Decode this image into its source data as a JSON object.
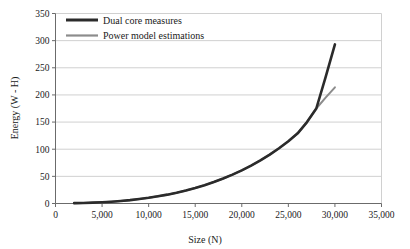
{
  "chart_data": {
    "type": "line",
    "title": "",
    "xlabel": "Size (N)",
    "ylabel": "Energy (W - H)",
    "xlim": [
      0,
      35000
    ],
    "ylim": [
      0,
      350
    ],
    "xticks": [
      0,
      5000,
      10000,
      15000,
      20000,
      25000,
      30000,
      35000
    ],
    "xtick_labels": [
      "0",
      "5,000",
      "10,000",
      "15,000",
      "20,000",
      "25,000",
      "30,000",
      "35,000"
    ],
    "yticks": [
      0,
      50,
      100,
      150,
      200,
      250,
      300,
      350
    ],
    "ytick_labels": [
      "0",
      "50",
      "100",
      "150",
      "200",
      "250",
      "300",
      "350"
    ],
    "grid": "horizontal",
    "legend_position": "top-left",
    "series": [
      {
        "name": "Dual core measures",
        "color": "#2b2b2b",
        "width": 2.6,
        "points": [
          [
            2000,
            0.6
          ],
          [
            3000,
            1.0
          ],
          [
            4000,
            1.6
          ],
          [
            5000,
            2.3
          ],
          [
            6000,
            3.3
          ],
          [
            7000,
            4.6
          ],
          [
            8000,
            6.2
          ],
          [
            9000,
            8.2
          ],
          [
            10000,
            10.5
          ],
          [
            11000,
            13.2
          ],
          [
            12000,
            16.3
          ],
          [
            13000,
            19.9
          ],
          [
            14000,
            24.0
          ],
          [
            15000,
            28.6
          ],
          [
            16000,
            33.8
          ],
          [
            17000,
            39.6
          ],
          [
            18000,
            46.0
          ],
          [
            19000,
            53.1
          ],
          [
            20000,
            61.0
          ],
          [
            21000,
            69.7
          ],
          [
            22000,
            79.3
          ],
          [
            23000,
            90.0
          ],
          [
            24000,
            101.8
          ],
          [
            25000,
            114.8
          ],
          [
            26000,
            129.2
          ],
          [
            27000,
            150.0
          ],
          [
            28000,
            175.0
          ],
          [
            29000,
            233.0
          ],
          [
            30000,
            293.0
          ]
        ]
      },
      {
        "name": "Power model estimations",
        "color": "#8c8c8c",
        "width": 2.0,
        "points": [
          [
            2000,
            0.6
          ],
          [
            3000,
            1.0
          ],
          [
            4000,
            1.6
          ],
          [
            5000,
            2.3
          ],
          [
            6000,
            3.3
          ],
          [
            7000,
            4.6
          ],
          [
            8000,
            6.2
          ],
          [
            9000,
            8.2
          ],
          [
            10000,
            10.5
          ],
          [
            11000,
            13.2
          ],
          [
            12000,
            16.3
          ],
          [
            13000,
            19.9
          ],
          [
            14000,
            24.0
          ],
          [
            15000,
            28.6
          ],
          [
            16000,
            33.8
          ],
          [
            17000,
            39.6
          ],
          [
            18000,
            46.0
          ],
          [
            19000,
            53.1
          ],
          [
            20000,
            61.0
          ],
          [
            21000,
            69.7
          ],
          [
            22000,
            79.3
          ],
          [
            23000,
            90.0
          ],
          [
            24000,
            101.8
          ],
          [
            25000,
            114.8
          ],
          [
            26000,
            129.2
          ],
          [
            27000,
            150.0
          ],
          [
            28000,
            175.0
          ],
          [
            29000,
            195.0
          ],
          [
            30000,
            214.0
          ]
        ]
      }
    ],
    "legend": [
      {
        "label": "Dual core measures",
        "color": "#2b2b2b",
        "width": 3.0
      },
      {
        "label": "Power model estimations",
        "color": "#8c8c8c",
        "width": 2.2
      }
    ],
    "colors": {
      "axis": "#6b6b6b",
      "grid": "#d0d0d0",
      "background": "#ffffff",
      "text": "#1a1a1a"
    }
  }
}
